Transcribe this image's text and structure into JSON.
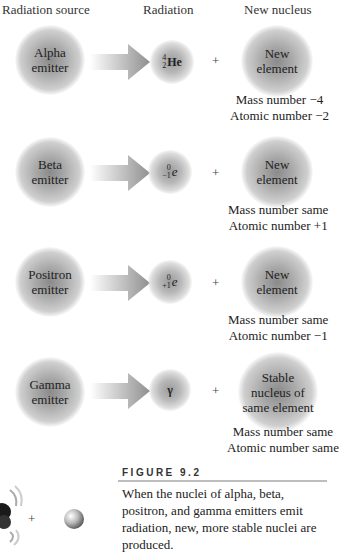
{
  "headers": {
    "source": "Radiation source",
    "radiation": "Radiation",
    "new_nucleus": "New nucleus"
  },
  "rows": [
    {
      "emitter": [
        "Alpha",
        "emitter"
      ],
      "radiation": {
        "mass": "4",
        "atomic": "2",
        "symbol": "He"
      },
      "product": [
        "New",
        "element"
      ],
      "change": [
        "Mass number −4",
        "Atomic number −2"
      ]
    },
    {
      "emitter": [
        "Beta",
        "emitter"
      ],
      "radiation": {
        "mass": "0",
        "atomic": "−1",
        "symbol": "e"
      },
      "product": [
        "New",
        "element"
      ],
      "change": [
        "Mass number same",
        "Atomic number +1"
      ]
    },
    {
      "emitter": [
        "Positron",
        "emitter"
      ],
      "radiation": {
        "mass": "0",
        "atomic": "+1",
        "symbol": "e"
      },
      "product": [
        "New",
        "element"
      ],
      "change": [
        "Mass number same",
        "Atomic number −1"
      ]
    },
    {
      "emitter": [
        "Gamma",
        "emitter"
      ],
      "radiation": {
        "symbol": "γ"
      },
      "product": [
        "Stable",
        "nucleus of",
        "same element"
      ],
      "change": [
        "Mass number same",
        "Atomic number same"
      ]
    }
  ],
  "plus_sign": "+",
  "figure": {
    "title": "FIGURE 9.2",
    "caption": "When the nuclei of alpha, beta, positron, and gamma emitters emit radiation, new, more stable nuclei are produced."
  },
  "colors": {
    "sphere_core": "#8a8a8a",
    "arrow": "#9a9a9a",
    "rule": "#bdbdbd",
    "text": "#222222"
  }
}
